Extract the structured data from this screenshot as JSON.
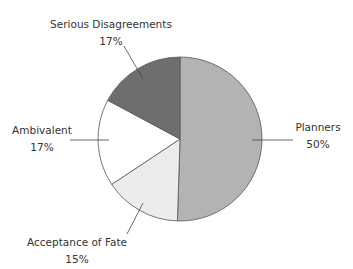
{
  "chart_data": {
    "type": "pie",
    "title": "",
    "start": "top, clockwise",
    "slices": [
      {
        "label": "Planners",
        "value": 50,
        "display": "50%",
        "color": "#b3b3b3"
      },
      {
        "label": "Acceptance of Fate",
        "value": 15,
        "display": "15%",
        "color": "#ececec"
      },
      {
        "label": "Ambivalent",
        "value": 17,
        "display": "17%",
        "color": "#ffffff"
      },
      {
        "label": "Serious Disagreements",
        "value": 17,
        "display": "17%",
        "color": "#6e6e6e"
      }
    ],
    "stroke_color": "#555555",
    "label_color": "#333333"
  }
}
